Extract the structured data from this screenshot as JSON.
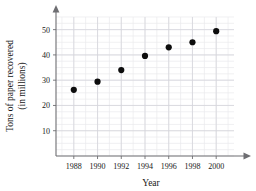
{
  "chart_data": {
    "type": "scatter",
    "title": "",
    "xlabel": "Year",
    "ylabel": "Tons of paper recovered (in millions)",
    "ylabel_line1": "Tons of paper recovered",
    "ylabel_line2": "(in millions)",
    "x": [
      1988,
      1990,
      1992,
      1994,
      1996,
      1998,
      2000
    ],
    "values": [
      26.2,
      29.4,
      34.0,
      39.6,
      43.0,
      45.0,
      49.4
    ],
    "points": [
      {
        "year": 1988,
        "tons": 26.2
      },
      {
        "year": 1990,
        "tons": 29.4
      },
      {
        "year": 1992,
        "tons": 34.0
      },
      {
        "year": 1994,
        "tons": 39.6
      },
      {
        "year": 1996,
        "tons": 43.0
      },
      {
        "year": 1998,
        "tons": 45.0
      },
      {
        "year": 2000,
        "tons": 49.4
      }
    ],
    "xtick_labels": [
      "1988",
      "1990",
      "1992",
      "1994",
      "1996",
      "1998",
      "2000"
    ],
    "ytick_labels": [
      "10",
      "20",
      "30",
      "40",
      "50"
    ],
    "ytick_values": [
      10,
      20,
      30,
      40,
      50
    ],
    "xlim": [
      1986.5,
      2001.5
    ],
    "ylim": [
      0,
      55
    ],
    "grid": true,
    "grid_minor_x_step": 1,
    "grid_minor_y_step": 2.5,
    "legend": "none",
    "marker": "filled-circle",
    "marker_color": "#0d0d0d"
  },
  "axes": {
    "x_axis_name": "year-axis",
    "y_axis_name": "tons-axis"
  }
}
